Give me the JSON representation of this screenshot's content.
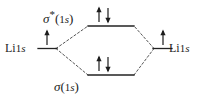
{
  "diagram": {
    "type": "molecular-orbital-diagram",
    "colors": {
      "ink": "#1c1c1c",
      "background": "#ffffff",
      "level_line": "#222222",
      "correlation_line": "#555555",
      "arrow": "#1c1c1c"
    },
    "levels": {
      "antibonding": {
        "label_sigma": "σ",
        "label_star": "*",
        "label_open_paren": "(",
        "label_orbital_number": "1",
        "label_orbital_letter": "s",
        "label_close_paren": ")",
        "label_full": "σ*(1s)",
        "electrons": 2,
        "spins": [
          "up",
          "down"
        ]
      },
      "bonding": {
        "label_sigma": "σ",
        "label_open_paren": "(",
        "label_orbital_number": "1",
        "label_orbital_letter": "s",
        "label_close_paren": ")",
        "label_full": "σ(1s)",
        "electrons": 2,
        "spins": [
          "up",
          "down"
        ]
      },
      "atomic_left": {
        "element": "Li",
        "orbital_number": "1",
        "orbital_letter": "s",
        "label_full": "Li 1s",
        "electrons": 1,
        "spins": [
          "up"
        ]
      },
      "atomic_right": {
        "element": "Li",
        "orbital_number": "1",
        "orbital_letter": "s",
        "label_full": "Li 1s",
        "electrons": 1,
        "spins": [
          "up"
        ]
      }
    }
  }
}
